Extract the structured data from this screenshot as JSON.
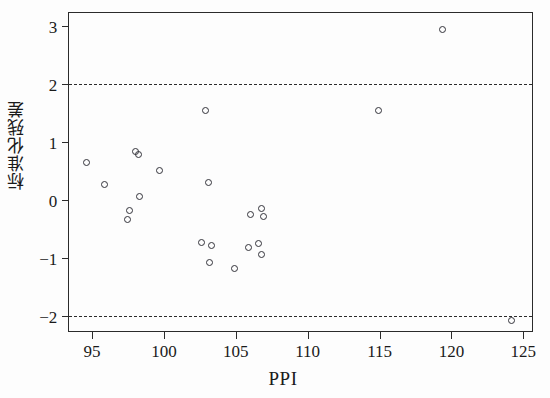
{
  "figure": {
    "background": "#fdfdfd",
    "frame_color": "#2b2b2b",
    "point_color": "#33333a"
  },
  "axis": {
    "x_title": "PPI",
    "y_title": "标准化残差",
    "x_ticks": [
      "95",
      "100",
      "105",
      "110",
      "115",
      "120",
      "125"
    ],
    "y_ticks": [
      "3",
      "2",
      "1",
      "0",
      "−1",
      "−2"
    ]
  },
  "chart_data": {
    "type": "scatter",
    "title": "",
    "xlabel": "PPI",
    "ylabel": "标准化残差",
    "xlim": [
      93.4,
      125.6
    ],
    "ylim": [
      -2.25,
      3.22
    ],
    "xticks": [
      95,
      100,
      105,
      110,
      115,
      120,
      125
    ],
    "yticks": [
      3,
      2,
      1,
      0,
      -1,
      -2
    ],
    "grid": false,
    "legend": null,
    "marker": "open-circle",
    "reference_lines": [
      {
        "axis": "y",
        "value": 2,
        "style": "dashed",
        "label": ""
      },
      {
        "axis": "y",
        "value": -2,
        "style": "dashed",
        "label": ""
      }
    ],
    "points": [
      {
        "x": 94.6,
        "y": 0.65
      },
      {
        "x": 95.9,
        "y": 0.27
      },
      {
        "x": 97.6,
        "y": -0.18
      },
      {
        "x": 97.5,
        "y": -0.33
      },
      {
        "x": 98.0,
        "y": 0.83
      },
      {
        "x": 98.2,
        "y": 0.79
      },
      {
        "x": 98.3,
        "y": 0.06
      },
      {
        "x": 99.7,
        "y": 0.51
      },
      {
        "x": 102.9,
        "y": 1.54
      },
      {
        "x": 103.1,
        "y": 0.3
      },
      {
        "x": 102.6,
        "y": -0.72
      },
      {
        "x": 103.3,
        "y": -0.78
      },
      {
        "x": 103.2,
        "y": -1.08
      },
      {
        "x": 104.9,
        "y": -1.17
      },
      {
        "x": 105.9,
        "y": -0.81
      },
      {
        "x": 106.6,
        "y": -0.75
      },
      {
        "x": 106.8,
        "y": -0.93
      },
      {
        "x": 106.0,
        "y": -0.25
      },
      {
        "x": 106.8,
        "y": -0.14
      },
      {
        "x": 106.9,
        "y": -0.28
      },
      {
        "x": 114.9,
        "y": 1.54
      },
      {
        "x": 119.4,
        "y": 2.93
      },
      {
        "x": 124.2,
        "y": -2.07
      }
    ]
  }
}
